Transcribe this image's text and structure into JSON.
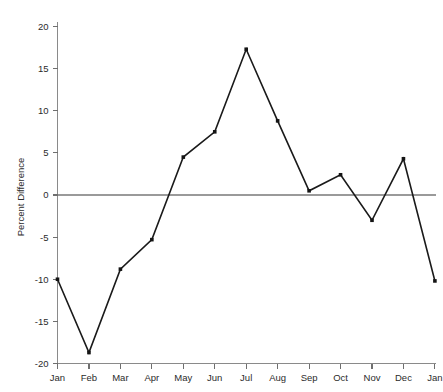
{
  "chart_data": {
    "type": "line",
    "title": "",
    "xlabel": "",
    "ylabel": "Percent Difference",
    "categories": [
      "Jan",
      "Feb",
      "Mar",
      "Apr",
      "May",
      "Jun",
      "Jul",
      "Aug",
      "Sep",
      "Oct",
      "Nov",
      "Dec",
      "Jan"
    ],
    "values": [
      -10.0,
      -18.7,
      -8.8,
      -5.3,
      4.5,
      7.5,
      17.3,
      8.8,
      0.5,
      2.4,
      -3.0,
      4.3,
      -10.2
    ],
    "series": [
      {
        "name": "Percent Difference",
        "values": [
          -10.0,
          -18.7,
          -8.8,
          -5.3,
          4.5,
          7.5,
          17.3,
          8.8,
          0.5,
          2.4,
          -3.0,
          4.3,
          -10.2
        ]
      }
    ],
    "ylim": [
      -20,
      20
    ],
    "yticks": [
      20,
      15,
      10,
      5,
      0,
      -5,
      -10,
      -15,
      -20
    ],
    "ytick_labels": [
      "20",
      "15",
      "10",
      "5",
      "0",
      "-5",
      "-10",
      "-15",
      "-20"
    ],
    "xticks": [
      "Jan",
      "Feb",
      "Mar",
      "Apr",
      "May",
      "Jun",
      "Jul",
      "Aug",
      "Sep",
      "Oct",
      "Nov",
      "Dec",
      "Jan"
    ],
    "grid": false,
    "zero_line": true,
    "legend": "none",
    "marker": "square",
    "colors": {
      "line": "#1a1a1a",
      "marker": "#141414",
      "axis": "#8a8a8a",
      "zero_line": "#9a9a9a",
      "text": "#2b2b2b",
      "background": "#ffffff"
    }
  }
}
